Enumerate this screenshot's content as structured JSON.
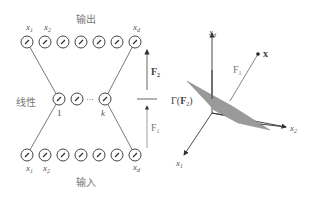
{
  "left_diagram": {
    "output_label": "输出",
    "input_label": "输入",
    "hidden_label": "线性",
    "top_labels": {
      "x1": "x",
      "x1_sub": "1",
      "x2": "x",
      "x2_sub": "2",
      "xd": "x",
      "xd_sub": "d"
    },
    "bottom_labels": {
      "x1": "x",
      "x1_sub": "1",
      "x2": "x",
      "x2_sub": "2",
      "xd": "x",
      "xd_sub": "d"
    },
    "hidden_first": "1",
    "hidden_last": "k",
    "hidden_ellipsis": "···",
    "node_count_per_row": 7,
    "arrow_upper_label": "F",
    "arrow_upper_sub": "2",
    "arrow_lower_label": "F",
    "arrow_lower_sub": "1"
  },
  "right_diagram": {
    "axis_d": "x",
    "axis_d_sub": "d",
    "axis_1": "x",
    "axis_1_sub": "1",
    "axis_2": "x",
    "axis_2_sub": "2",
    "point_label": "x",
    "projection_label": "F",
    "projection_sub": "1",
    "manifold_label_prefix": "Γ(",
    "manifold_label_F": "F",
    "manifold_label_sub": "2",
    "manifold_label_suffix": ")",
    "plane_color": "#9a9a9a"
  }
}
